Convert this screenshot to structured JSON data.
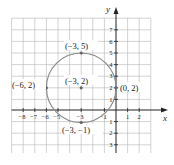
{
  "figure": {
    "axes": {
      "x_label": "x",
      "y_label": "y"
    },
    "grid": {
      "x_min": -9,
      "x_max": 3,
      "y_min": -4,
      "y_max": 8,
      "unit_px": 11.6,
      "origin_px": [
        116,
        110
      ]
    },
    "x_ticks": [
      "-8",
      "-7",
      "-6",
      "-5",
      "-3",
      "-1",
      "1",
      "2"
    ],
    "x_tick_values": [
      -8,
      -7,
      -6,
      -5,
      -3,
      -1,
      1,
      2
    ],
    "y_ticks": [
      "7",
      "6",
      "5",
      "4",
      "3",
      "2",
      "1",
      "-1",
      "-2",
      "-3"
    ],
    "y_tick_values": [
      7,
      6,
      5,
      4,
      3,
      2,
      1,
      -1,
      -2,
      -3
    ],
    "circle": {
      "center": [
        -3,
        2
      ],
      "radius": 3,
      "stroke": "#8a8a8a"
    },
    "points": [
      {
        "label": "(-3, 5)",
        "x": -3,
        "y": 5
      },
      {
        "label": "(-3, 2)",
        "x": -3,
        "y": 2
      },
      {
        "label": "(-6, 2)",
        "x": -6,
        "y": 2
      },
      {
        "label": "(0, 2)",
        "x": 0,
        "y": 2
      },
      {
        "label": "(-3, -1)",
        "x": -3,
        "y": -1
      }
    ],
    "point_labels": {
      "top": "(−3, 5)",
      "center": "(−3, 2)",
      "left": "(−6, 2)",
      "right": "(0, 2)",
      "bottom": "(−3, −1)"
    },
    "tick_text": {
      "x_neg8": "−8",
      "x_neg7": "−7",
      "x_neg6": "−6",
      "x_neg5": "−5",
      "x_neg3": "−3",
      "x_neg1": "−1",
      "x_1": "1",
      "x_2": "2",
      "y_7": "7",
      "y_6": "6",
      "y_5": "5",
      "y_4": "4",
      "y_3": "3",
      "y_2": "2",
      "y_1": "1",
      "y_neg1": "1",
      "y_neg2": "2",
      "y_neg3": "3"
    }
  }
}
